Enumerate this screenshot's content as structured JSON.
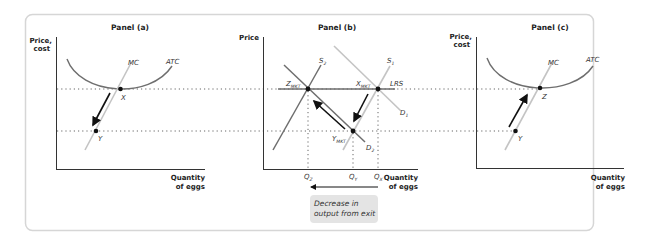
{
  "figure": {
    "panels": [
      {
        "title": "Panel (a)",
        "y_axis_label_line1": "Price,",
        "y_axis_label_line2": "cost",
        "x_axis_label_line1": "Quantity",
        "x_axis_label_line2": "of eggs",
        "curves": {
          "mc": "MC",
          "atc": "ATC"
        },
        "points": {
          "upper": "X",
          "lower": "Y"
        }
      },
      {
        "title": "Panel (b)",
        "y_axis_label_line1": "Price",
        "x_axis_label_line1": "Quantity",
        "x_axis_label_line2": "of eggs",
        "curves": {
          "s1_base": "S",
          "s1_sub": "1",
          "s2_base": "S",
          "s2_sub": "2",
          "d1_base": "D",
          "d1_sub": "1",
          "d2_base": "D",
          "d2_sub": "2",
          "lrs": "LRS"
        },
        "points": {
          "z_base": "Z",
          "z_sub": "MKT",
          "x_base": "X",
          "x_sub": "MKT",
          "y_base": "Y",
          "y_sub": "MKT"
        },
        "x_ticks": [
          {
            "base": "Q",
            "sub": "Z"
          },
          {
            "base": "Q",
            "sub": "Y"
          },
          {
            "base": "Q",
            "sub": "X"
          }
        ],
        "annotation_line1": "Decrease in",
        "annotation_line2": "output from exit"
      },
      {
        "title": "Panel (c)",
        "y_axis_label_line1": "Price,",
        "y_axis_label_line2": "cost",
        "x_axis_label_line1": "Quantity",
        "x_axis_label_line2": "of eggs",
        "curves": {
          "mc": "MC",
          "atc": "ATC"
        },
        "points": {
          "upper": "Z",
          "lower": "Y"
        }
      }
    ],
    "colors": {
      "curve_dark": "#6e6e6e",
      "curve_light": "#c4c4c4",
      "axis": "#333333",
      "point": "#111111",
      "arrow": "#111111",
      "note_bg": "#e4e4e4",
      "frame": "#d6d6d6"
    }
  }
}
